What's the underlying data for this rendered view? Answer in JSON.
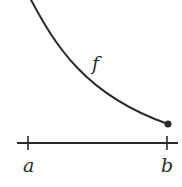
{
  "diagram": {
    "curve_label": "f",
    "left_endpoint_label": "a",
    "right_endpoint_label": "b",
    "colors": {
      "stroke": "#2a2a2a",
      "background": "#ffffff"
    }
  }
}
